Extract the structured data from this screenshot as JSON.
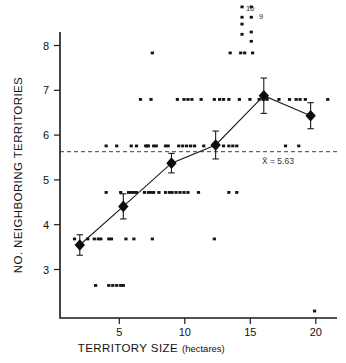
{
  "chart_data": {
    "type": "scatter",
    "title": "",
    "xlabel": "TERRITORY SIZE",
    "xlabel_unit": "(hectares)",
    "ylabel": "NO. NEIGHBORING TERRITORIES",
    "xlim": [
      0.5,
      21.5
    ],
    "ylim": [
      2.3,
      8.45
    ],
    "xticks": [
      5,
      10,
      15,
      20
    ],
    "yticks": [
      3,
      4,
      5,
      6,
      7,
      8
    ],
    "grid": false,
    "legend": null,
    "reference_line": {
      "type": "horizontal",
      "value": 5.63,
      "label": "X̄ = 5.63",
      "style": "dashed"
    },
    "offscale_labels": [
      {
        "text": "10",
        "x": 14.3,
        "y": 8.95
      },
      {
        "text": "9",
        "x": 15.0,
        "y": 8.72
      }
    ],
    "series": [
      {
        "name": "binned mean",
        "type": "line-marker",
        "marker": "diamond",
        "x": [
          2.0,
          5.3,
          8.95,
          12.3,
          15.95,
          19.5
        ],
        "y": [
          3.87,
          4.7,
          5.63,
          6.02,
          7.08,
          6.65
        ],
        "yerr": [
          0.22,
          0.27,
          0.21,
          0.3,
          0.38,
          0.28
        ]
      },
      {
        "name": "individual territories",
        "type": "scatter",
        "points": [
          [
            7.5,
            8.0
          ],
          [
            13.4,
            8.0
          ],
          [
            14.2,
            8.0
          ],
          [
            14.5,
            8.0
          ],
          [
            15.1,
            8.0
          ],
          [
            14.3,
            8.62
          ],
          [
            14.3,
            8.4
          ],
          [
            15.0,
            8.45
          ],
          [
            15.0,
            8.25
          ],
          [
            6.6,
            7.0
          ],
          [
            7.4,
            7.0
          ],
          [
            9.4,
            7.0
          ],
          [
            9.9,
            7.0
          ],
          [
            10.2,
            7.0
          ],
          [
            10.5,
            7.0
          ],
          [
            11.2,
            7.0
          ],
          [
            12.2,
            7.0
          ],
          [
            12.6,
            7.0
          ],
          [
            12.9,
            7.0
          ],
          [
            13.3,
            7.0
          ],
          [
            14.1,
            7.0
          ],
          [
            14.9,
            7.0
          ],
          [
            15.6,
            7.0
          ],
          [
            15.9,
            7.0
          ],
          [
            16.2,
            7.0
          ],
          [
            17.1,
            7.0
          ],
          [
            17.9,
            7.0
          ],
          [
            18.4,
            7.0
          ],
          [
            18.7,
            7.0
          ],
          [
            19.1,
            7.0
          ],
          [
            20.8,
            7.0
          ],
          [
            4.0,
            6.0
          ],
          [
            4.8,
            6.0
          ],
          [
            5.9,
            6.0
          ],
          [
            6.3,
            6.0
          ],
          [
            7.0,
            6.0
          ],
          [
            7.1,
            6.0
          ],
          [
            7.2,
            6.0
          ],
          [
            7.6,
            6.0
          ],
          [
            7.8,
            6.0
          ],
          [
            8.5,
            6.0
          ],
          [
            8.7,
            6.0
          ],
          [
            9.5,
            6.0
          ],
          [
            9.8,
            6.0
          ],
          [
            10.1,
            6.0
          ],
          [
            10.4,
            6.0
          ],
          [
            10.7,
            6.0
          ],
          [
            11.4,
            6.0
          ],
          [
            12.3,
            6.0
          ],
          [
            12.9,
            6.0
          ],
          [
            13.3,
            6.0
          ],
          [
            13.6,
            6.0
          ],
          [
            13.9,
            6.0
          ],
          [
            17.6,
            6.0
          ],
          [
            18.6,
            6.0
          ],
          [
            4.0,
            5.0
          ],
          [
            5.1,
            5.0
          ],
          [
            5.7,
            5.0
          ],
          [
            5.9,
            5.0
          ],
          [
            6.1,
            5.0
          ],
          [
            6.3,
            5.0
          ],
          [
            6.9,
            5.0
          ],
          [
            7.2,
            5.0
          ],
          [
            7.4,
            5.0
          ],
          [
            7.6,
            5.0
          ],
          [
            8.0,
            5.0
          ],
          [
            8.5,
            5.0
          ],
          [
            8.8,
            5.0
          ],
          [
            9.0,
            5.0
          ],
          [
            9.3,
            5.0
          ],
          [
            9.6,
            5.0
          ],
          [
            9.9,
            5.0
          ],
          [
            10.2,
            5.0
          ],
          [
            11.0,
            5.0
          ],
          [
            13.3,
            5.0
          ],
          [
            13.9,
            5.0
          ],
          [
            1.6,
            4.0
          ],
          [
            2.6,
            4.0
          ],
          [
            3.1,
            4.0
          ],
          [
            3.4,
            4.0
          ],
          [
            3.6,
            4.0
          ],
          [
            4.2,
            4.0
          ],
          [
            4.4,
            4.0
          ],
          [
            5.5,
            4.0
          ],
          [
            6.1,
            4.0
          ],
          [
            7.5,
            4.0
          ],
          [
            12.2,
            4.0
          ],
          [
            3.2,
            3.0
          ],
          [
            4.2,
            3.0
          ],
          [
            4.5,
            3.0
          ],
          [
            4.8,
            3.0
          ],
          [
            5.1,
            3.0
          ],
          [
            5.3,
            3.0
          ],
          [
            19.8,
            2.45
          ]
        ]
      }
    ]
  }
}
